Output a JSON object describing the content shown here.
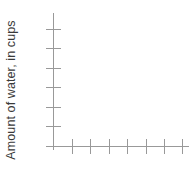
{
  "chart_data": {
    "type": "line",
    "title": "",
    "xlabel": "",
    "ylabel": "Amount of water, in cups",
    "series": [],
    "x": [],
    "values": [],
    "grid": false,
    "legend": null,
    "annotations": [],
    "x_tick_count": 7,
    "y_tick_count": 6,
    "x_tick_labels": [],
    "y_tick_labels": [],
    "empty_plot": true
  },
  "axes": {
    "y_title": "Amount of water, in cups",
    "axis_color": "#999999",
    "text_color": "#3a3a3a",
    "background_color": "#ffffff",
    "origin": {
      "x": 53,
      "y": 146
    },
    "y_axis": {
      "top": 13,
      "bottom": 150
    },
    "x_axis": {
      "left": 46,
      "right": 189
    },
    "y_ticks": [
      {
        "y": 29,
        "x_start": 46,
        "x_end": 61
      },
      {
        "y": 48,
        "x_start": 46,
        "x_end": 61
      },
      {
        "y": 68,
        "x_start": 46,
        "x_end": 61
      },
      {
        "y": 87,
        "x_start": 46,
        "x_end": 61
      },
      {
        "y": 107,
        "x_start": 46,
        "x_end": 61
      },
      {
        "y": 126,
        "x_start": 46,
        "x_end": 61
      }
    ],
    "x_ticks": [
      {
        "x": 72,
        "y_start": 139,
        "y_end": 154
      },
      {
        "x": 90,
        "y_start": 139,
        "y_end": 154
      },
      {
        "x": 109,
        "y_start": 139,
        "y_end": 154
      },
      {
        "x": 127,
        "y_start": 139,
        "y_end": 154
      },
      {
        "x": 146,
        "y_start": 139,
        "y_end": 154
      },
      {
        "x": 164,
        "y_start": 139,
        "y_end": 154
      },
      {
        "x": 182,
        "y_start": 139,
        "y_end": 154
      }
    ]
  }
}
